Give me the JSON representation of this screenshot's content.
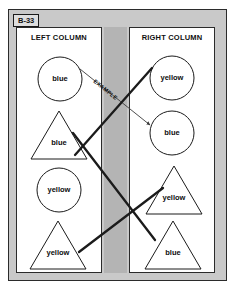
{
  "worksheet": {
    "id_tag": "B-33",
    "columns": {
      "left_title": "LEFT COLUMN",
      "right_title": "RIGHT COLUMN"
    },
    "example_label": "EXAMPLE",
    "colors": {
      "frame": "#c9c9c9",
      "gutter": "#b4b4b4",
      "panel": "#ffffff",
      "ink": "#1b1b1b"
    },
    "left_items": [
      {
        "shape": "circle",
        "label": "blue",
        "cx": 60,
        "cy": 79,
        "r": 22
      },
      {
        "shape": "triangle",
        "label": "blue",
        "cx": 59,
        "cy": 135,
        "half": 28,
        "height": 48
      },
      {
        "shape": "circle",
        "label": "yellow",
        "cx": 59,
        "cy": 190,
        "r": 22
      },
      {
        "shape": "triangle",
        "label": "yellow",
        "cx": 58,
        "cy": 245,
        "half": 28,
        "height": 48
      }
    ],
    "right_items": [
      {
        "shape": "circle",
        "label": "yellow",
        "cx": 172,
        "cy": 78,
        "r": 22
      },
      {
        "shape": "circle",
        "label": "blue",
        "cx": 172,
        "cy": 133,
        "r": 22
      },
      {
        "shape": "triangle",
        "label": "yellow",
        "cx": 174,
        "cy": 190,
        "half": 28,
        "height": 48
      },
      {
        "shape": "triangle",
        "label": "blue",
        "cx": 173,
        "cy": 245,
        "half": 28,
        "height": 48
      }
    ],
    "connections": [
      {
        "from": "left-circle-blue",
        "to": "right-circle-blue",
        "style": "example",
        "x1": 80,
        "y1": 69,
        "x2": 150,
        "y2": 125
      },
      {
        "from": "left-triangle-blue",
        "to": "right-circle-yellow",
        "style": "match",
        "x1": 75,
        "y1": 155,
        "x2": 152,
        "y2": 68
      },
      {
        "from": "left-circle-yellow",
        "to": "right-triangle-blue",
        "style": "match",
        "x1": 73,
        "y1": 133,
        "x2": 155,
        "y2": 240
      },
      {
        "from": "left-triangle-yellow",
        "to": "right-triangle-yellow",
        "style": "match",
        "x1": 79,
        "y1": 252,
        "x2": 163,
        "y2": 188
      }
    ]
  }
}
